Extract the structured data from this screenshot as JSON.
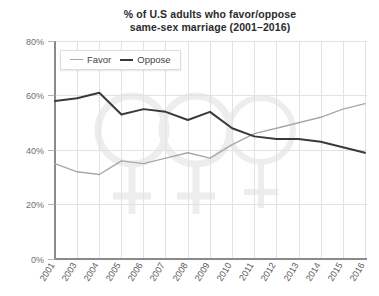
{
  "chart_data": {
    "type": "line",
    "title": "% of U.S adults who favor/oppose same-sex marriage (2001–2016)",
    "title_line1": "% of U.S adults who favor/oppose",
    "title_line2": "same-sex marriage (2001–2016)",
    "xlabel": "",
    "ylabel": "",
    "categories": [
      "2001",
      "2003",
      "2004",
      "2005",
      "2006",
      "2007",
      "2008",
      "2009",
      "2010",
      "2011",
      "2012",
      "2013",
      "2014",
      "2015",
      "2016"
    ],
    "series": [
      {
        "name": "Favor",
        "color": "#a8a8a8",
        "values": [
          35,
          32,
          31,
          36,
          35,
          37,
          39,
          37,
          42,
          46,
          48,
          50,
          52,
          55,
          57
        ]
      },
      {
        "name": "Oppose",
        "color": "#3a3a3a",
        "values": [
          58,
          59,
          61,
          53,
          55,
          54,
          51,
          54,
          48,
          45,
          44,
          44,
          43,
          41,
          39
        ]
      }
    ],
    "ylim": [
      0,
      80
    ],
    "yticks": [
      0,
      20,
      40,
      60,
      80
    ],
    "ytick_labels": [
      "0%",
      "20%",
      "40%",
      "60%",
      "80%"
    ],
    "grid": true,
    "legend_position": "top-left-inside"
  },
  "legend": {
    "entries": [
      {
        "label": "Favor",
        "color": "#a8a8a8"
      },
      {
        "label": "Oppose",
        "color": "#3a3a3a"
      }
    ]
  },
  "watermark": {
    "name": "gender-symbols-watermark",
    "color": "#ededed"
  }
}
